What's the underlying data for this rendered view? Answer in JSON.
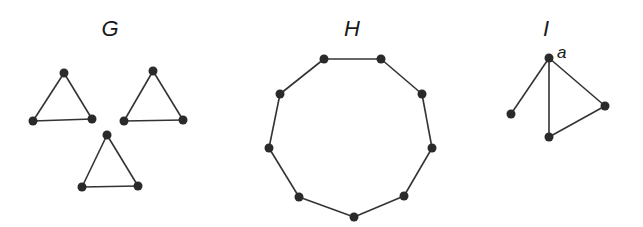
{
  "graphs": [
    {
      "label": "G",
      "label_pos": [
        110,
        36
      ],
      "description": "three disjoint triangles",
      "nodes": [
        [
          64,
          73
        ],
        [
          33,
          121
        ],
        [
          92,
          119
        ],
        [
          153,
          71
        ],
        [
          124,
          121
        ],
        [
          183,
          120
        ],
        [
          107,
          135
        ],
        [
          82,
          187
        ],
        [
          138,
          186
        ]
      ],
      "edges": [
        [
          0,
          1
        ],
        [
          0,
          2
        ],
        [
          1,
          2
        ],
        [
          3,
          4
        ],
        [
          3,
          5
        ],
        [
          4,
          5
        ],
        [
          6,
          7
        ],
        [
          6,
          8
        ],
        [
          7,
          8
        ]
      ]
    },
    {
      "label": "H",
      "label_pos": [
        352,
        36
      ],
      "description": "9-cycle",
      "nodes": [
        [
          324,
          59
        ],
        [
          381,
          59
        ],
        [
          422,
          94
        ],
        [
          432,
          148
        ],
        [
          404,
          196
        ],
        [
          354,
          217
        ],
        [
          299,
          197
        ],
        [
          269,
          148
        ],
        [
          280,
          94
        ]
      ],
      "edges": [
        [
          0,
          1
        ],
        [
          1,
          2
        ],
        [
          2,
          3
        ],
        [
          3,
          4
        ],
        [
          4,
          5
        ],
        [
          5,
          6
        ],
        [
          6,
          7
        ],
        [
          7,
          8
        ],
        [
          8,
          0
        ]
      ]
    },
    {
      "label": "I",
      "label_pos": [
        546,
        36
      ],
      "description": "triangle with pendant vertex at a",
      "vertex_labels": [
        {
          "text": "a",
          "node": 0,
          "pos": [
            557,
            58
          ]
        }
      ],
      "nodes": [
        [
          549,
          58
        ],
        [
          511,
          114
        ],
        [
          549,
          137
        ],
        [
          605,
          106
        ]
      ],
      "edges": [
        [
          0,
          1
        ],
        [
          0,
          2
        ],
        [
          0,
          3
        ],
        [
          2,
          3
        ]
      ]
    }
  ]
}
